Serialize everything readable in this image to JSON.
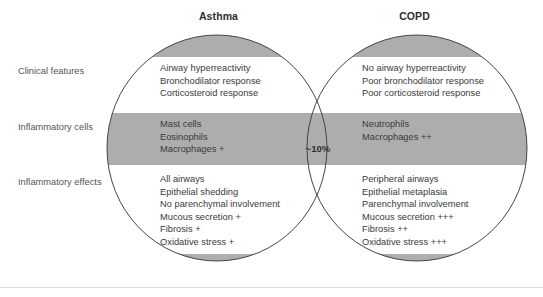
{
  "figure": {
    "type": "venn-diagram",
    "colors": {
      "band_gray": "#adadad",
      "band_white": "#ffffff",
      "outline": "#444444",
      "text": "#3a3a3a",
      "label_text": "#555555"
    },
    "circles": {
      "left": {
        "title": "Asthma"
      },
      "right": {
        "title": "COPD"
      }
    },
    "overlap": {
      "value": "~10%"
    },
    "row_labels": [
      "Clinical features",
      "Inflammatory cells",
      "Inflammatory effects"
    ],
    "rows": [
      {
        "label": "Clinical features",
        "shaded": false,
        "left": [
          "Airway hyperreactivity",
          "Bronchodilator response",
          "Corticosteroid response"
        ],
        "right": [
          "No airway hyperreactivity",
          "Poor bronchodilator response",
          "Poor corticosteroid response"
        ]
      },
      {
        "label": "Inflammatory cells",
        "shaded": true,
        "left": [
          "Mast cells",
          "Eosinophils",
          "Macrophages +"
        ],
        "right": [
          "Neutrophils",
          "Macrophages ++"
        ]
      },
      {
        "label": "Inflammatory effects",
        "shaded": false,
        "left": [
          "All airways",
          "Epithelial shedding",
          "No parenchymal involvement",
          "Mucous secretion +",
          "Fibrosis +",
          "Oxidative stress +"
        ],
        "right": [
          "Peripheral airways",
          "Epithelial metaplasia",
          "Parenchymal involvement",
          "Mucous secretion +++",
          "Fibrosis ++",
          "Oxidative stress +++"
        ]
      }
    ]
  }
}
